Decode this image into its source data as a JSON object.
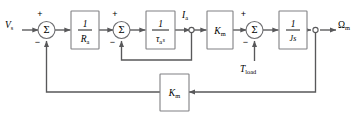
{
  "diagram": {
    "background_color": "#ffffff",
    "wire_color": "#58585a",
    "block_border_color": "#808083",
    "text_color": "#000000",
    "signals": {
      "input_label": "V",
      "input_subscript": "s",
      "current_label": "I",
      "current_subscript": "a",
      "disturbance_label": "T",
      "disturbance_subscript": "load",
      "output_label": "Ω",
      "output_subscript": "m"
    },
    "summing_junctions": [
      {
        "id": "sum-1",
        "symbol": "Σ",
        "input_sign": "+",
        "feedback_sign": "−",
        "feedback_from": "outer-speed-feedback"
      },
      {
        "id": "sum-2",
        "symbol": "Σ",
        "input_sign": "+",
        "feedback_sign": "−",
        "feedback_from": "inner-current-feedback"
      },
      {
        "id": "sum-3",
        "symbol": "Σ",
        "input_sign": "+",
        "feedback_sign": "−",
        "feedback_from": "torque-load-input"
      }
    ],
    "blocks": [
      {
        "id": "block-armature-resistance",
        "name": "armature-resistance-block",
        "numerator": "1",
        "denominator": "R",
        "denominator_subscript": "a",
        "expression": "1/Ra"
      },
      {
        "id": "block-armature-time-constant",
        "name": "armature-time-constant-block",
        "numerator": "1",
        "denominator": "τ",
        "denominator_subscript": "a",
        "denominator_suffix": "s",
        "expression": "1/(τa s)"
      },
      {
        "id": "block-torque-constant",
        "name": "torque-constant-block",
        "label": "K",
        "label_subscript": "m",
        "expression": "Km"
      },
      {
        "id": "block-inertia",
        "name": "inertia-block",
        "numerator": "1",
        "denominator": "J",
        "denominator_suffix": "s",
        "expression": "1/(Js)"
      },
      {
        "id": "block-back-emf",
        "name": "back-emf-constant-block",
        "label": "K",
        "label_subscript": "m",
        "expression": "Km"
      }
    ],
    "nodes": [
      {
        "id": "node-current",
        "name": "current-takeoff-node"
      },
      {
        "id": "node-speed",
        "name": "speed-takeoff-node"
      }
    ]
  }
}
